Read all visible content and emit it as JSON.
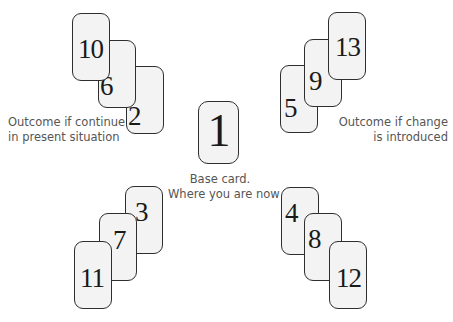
{
  "diagram": {
    "type": "tarot-spread",
    "colors": {
      "card_fill": "#f3f3f3",
      "card_border": "#2e2e2e",
      "numeral": "#1a1a1a",
      "label_text": "#555555",
      "background": "#ffffff"
    },
    "base": {
      "card": "1",
      "label_line1": "Base card.",
      "label_line2": "Where you are now"
    },
    "groups": {
      "top_left": {
        "cards": [
          "10",
          "6",
          "2"
        ],
        "label_line1": "Outcome if continue",
        "label_line2": "in present situation"
      },
      "top_right": {
        "cards": [
          "13",
          "9",
          "5"
        ],
        "label_line1": "Outcome if change",
        "label_line2": "is introduced"
      },
      "bottom_left": {
        "cards": [
          "3",
          "7",
          "11"
        ]
      },
      "bottom_right": {
        "cards": [
          "4",
          "8",
          "12"
        ]
      }
    }
  }
}
